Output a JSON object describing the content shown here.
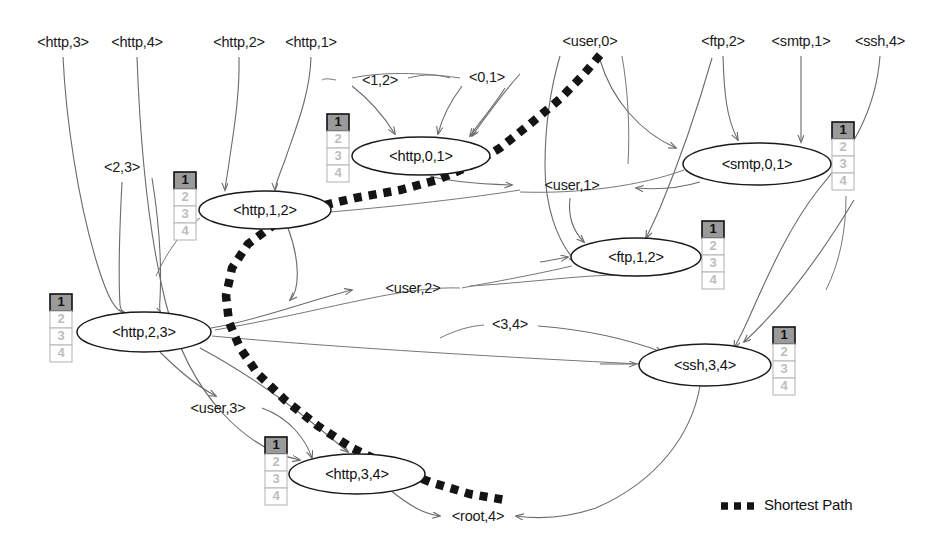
{
  "diagram": {
    "type": "attack-graph"
  },
  "nodes": [
    {
      "id": "http01",
      "label": "<http,0,1>",
      "cx": 421,
      "cy": 156,
      "rx": 69,
      "ry": 19,
      "badge_x": 327,
      "badge_y": 114
    },
    {
      "id": "smtp01",
      "label": "<smtp,0,1>",
      "cx": 757,
      "cy": 164,
      "rx": 74,
      "ry": 21,
      "badge_x": 832,
      "badge_y": 122
    },
    {
      "id": "http12",
      "label": "<http,1,2>",
      "cx": 265,
      "cy": 210,
      "rx": 66,
      "ry": 19,
      "badge_x": 174,
      "badge_y": 172
    },
    {
      "id": "ftp12",
      "label": "<ftp,1,2>",
      "cx": 636,
      "cy": 257,
      "rx": 65,
      "ry": 19,
      "badge_x": 702,
      "badge_y": 221
    },
    {
      "id": "http23",
      "label": "<http,2,3>",
      "cx": 144,
      "cy": 332,
      "rx": 67,
      "ry": 20,
      "badge_x": 50,
      "badge_y": 294
    },
    {
      "id": "ssh34",
      "label": "<ssh,3,4>",
      "cx": 705,
      "cy": 365,
      "rx": 66,
      "ry": 21,
      "badge_x": 773,
      "badge_y": 327
    },
    {
      "id": "http34",
      "label": "<http,3,4>",
      "cx": 357,
      "cy": 474,
      "rx": 68,
      "ry": 20,
      "badge_x": 265,
      "badge_y": 437
    }
  ],
  "badge_cells": [
    "1",
    "2",
    "3",
    "4"
  ],
  "badge_active_index": 0,
  "labels": [
    {
      "id": "http3",
      "text": "<http,3>",
      "x": 63,
      "y": 43
    },
    {
      "id": "http4",
      "text": "<http,4>",
      "x": 137,
      "y": 43
    },
    {
      "id": "http2",
      "text": "<http,2>",
      "x": 239,
      "y": 43
    },
    {
      "id": "http1",
      "text": "<http,1>",
      "x": 311,
      "y": 43
    },
    {
      "id": "user0",
      "text": "<user,0>",
      "x": 590,
      "y": 42
    },
    {
      "id": "ftp2",
      "text": "<ftp,2>",
      "x": 723,
      "y": 42
    },
    {
      "id": "smtp1",
      "text": "<smtp,1>",
      "x": 801,
      "y": 42
    },
    {
      "id": "ssh4",
      "text": "<ssh,4>",
      "x": 880,
      "y": 42
    },
    {
      "id": "e12",
      "text": "<1,2>",
      "x": 380,
      "y": 81
    },
    {
      "id": "e01",
      "text": "<0,1>",
      "x": 487,
      "y": 78
    },
    {
      "id": "e23",
      "text": "<2,3>",
      "x": 122,
      "y": 168
    },
    {
      "id": "user1",
      "text": "<user,1>",
      "x": 572,
      "y": 186
    },
    {
      "id": "user2",
      "text": "<user,2>",
      "x": 413,
      "y": 289
    },
    {
      "id": "e34",
      "text": "<3,4>",
      "x": 510,
      "y": 325
    },
    {
      "id": "user3",
      "text": "<user,3>",
      "x": 218,
      "y": 409
    },
    {
      "id": "root4",
      "text": "<root,4>",
      "x": 478,
      "y": 517
    }
  ],
  "legend": {
    "label": "Shortest Path",
    "swatch_x1": 721,
    "swatch_x2": 760,
    "swatch_y": 506,
    "text_x": 764,
    "text_y": 506
  },
  "shortest_path": {
    "points": "M 600 55 L 584 74 L 560 99 L 530 124 L 500 148 L 470 166 L 437 180 L 400 190 L 355 198 L 312 208 L 275 224 L 248 244 L 232 268 L 226 296 L 229 322 L 240 348 L 258 374 L 285 400 L 318 426 L 352 448 L 390 466 L 430 482 L 470 494 L 505 500"
  },
  "colors": {
    "path": "#141414",
    "edge": "#6b6b6b",
    "node_stroke": "#1a1a1a",
    "badge_active_fill": "#9a9a9a",
    "badge_inactive_text": "#bdbdbd",
    "background": "#ffffff"
  }
}
